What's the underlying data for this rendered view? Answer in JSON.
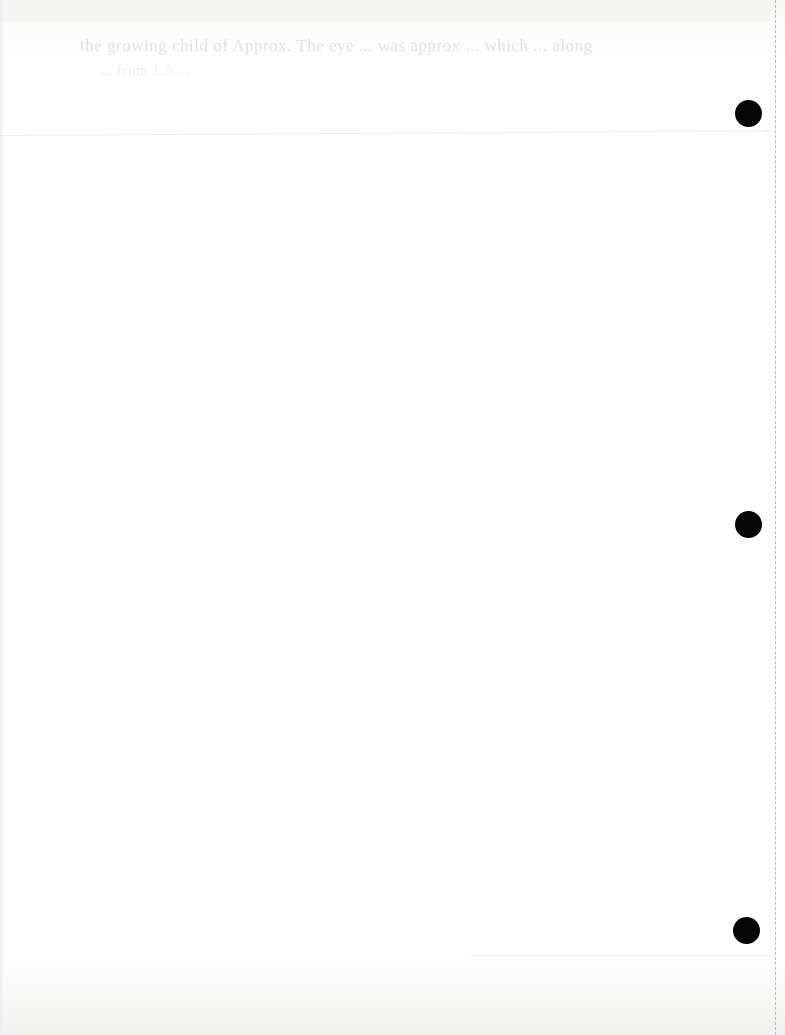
{
  "document": {
    "type": "scanned looseleaf page (mostly blank)",
    "bleed_through_text": {
      "line_1": "the growing child of Approx. The eye ... was approx ... which ... along",
      "line_2": "... from 1.5 ..."
    },
    "punch_holes": [
      {
        "id": "top",
        "cx": 748,
        "cy": 113
      },
      {
        "id": "middle",
        "cx": 748,
        "cy": 524
      },
      {
        "id": "bottom",
        "cx": 746,
        "cy": 930
      }
    ],
    "colors": {
      "paper": "#fefefe",
      "hole": "#050505",
      "perforation": "#b8b8b8",
      "bleed_text": "#c9c9c9"
    }
  }
}
